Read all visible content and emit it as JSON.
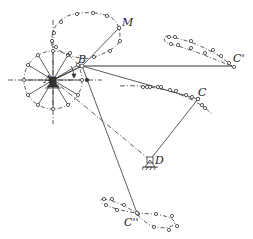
{
  "diagram": {
    "type": "four-bar linkage with coupler curves",
    "labels": {
      "A": "A",
      "B": "B",
      "M": "M",
      "C": "C",
      "C1": "C'",
      "C2": "C''",
      "D": "D"
    },
    "colors": {
      "line": "#333333",
      "background": "#ffffff"
    }
  }
}
